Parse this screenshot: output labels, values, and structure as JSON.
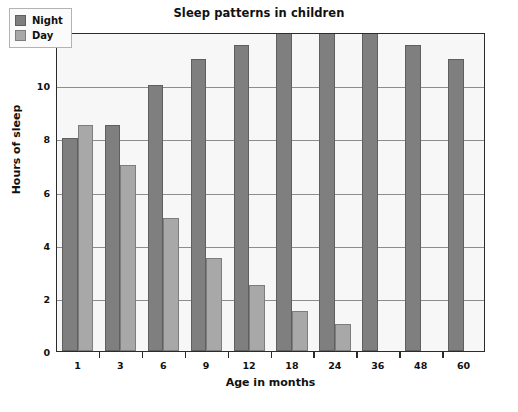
{
  "chart_data": {
    "type": "bar",
    "title": "Sleep patterns in children",
    "xlabel": "Age in months",
    "ylabel": "Hours of sleep",
    "categories": [
      "1",
      "3",
      "6",
      "9",
      "12",
      "18",
      "24",
      "36",
      "48",
      "60"
    ],
    "series": [
      {
        "name": "Night",
        "color": "#7f7f7f",
        "values": [
          8,
          8.5,
          10,
          11,
          11.5,
          12,
          12,
          12,
          11.5,
          11
        ]
      },
      {
        "name": "Day",
        "color": "#a8a8a8",
        "values": [
          8.5,
          7,
          5,
          3.5,
          2.5,
          1.5,
          1,
          null,
          null,
          null
        ]
      }
    ],
    "ylim": [
      0,
      12
    ],
    "yticks": [
      0,
      2,
      4,
      6,
      8,
      10,
      12
    ],
    "ytick_labels": [
      "0",
      "2",
      "4",
      "6",
      "8",
      "10",
      "12"
    ],
    "grid": true,
    "legend_position": "top-left",
    "plot_background": "#f7f7f7",
    "axis_color": "#2b2b2b",
    "gridline_color": "#8d8d8d"
  }
}
